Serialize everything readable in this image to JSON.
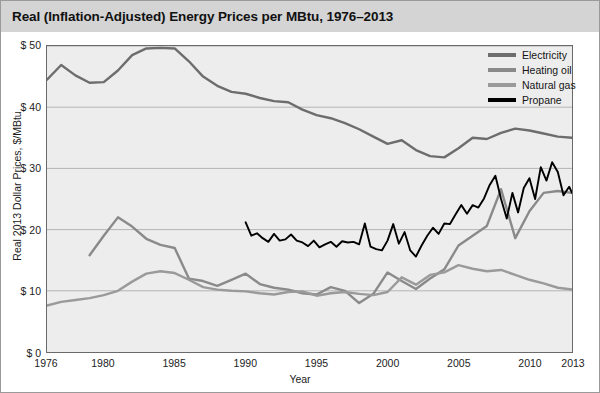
{
  "title": "Real (Inflation-Adjusted) Energy Prices per MBtu, 1976–2013",
  "axes": {
    "y_title": "Real 2013 Dollar Prices, $/MBtu",
    "x_title": "Year",
    "y_ticks": [
      "$ 0",
      "$ 10",
      "$ 20",
      "$ 30",
      "$ 40",
      "$ 50"
    ],
    "x_ticks": [
      "1976",
      "1980",
      "1985",
      "1990",
      "1995",
      "2000",
      "2005",
      "2010",
      "2013"
    ]
  },
  "legend": {
    "items": [
      {
        "label": "Electricity",
        "color": "#6d6d6d"
      },
      {
        "label": "Heating oil",
        "color": "#8a8a8a"
      },
      {
        "label": "Natural gas",
        "color": "#9a9a9a"
      },
      {
        "label": "Propane",
        "color": "#000000"
      }
    ]
  },
  "colors": {
    "title_bar": "#d4d4d4",
    "plot_background": "#ededed",
    "gridline": "#b4b4b4",
    "axis": "#6a6a6a",
    "electricity": "#6d6d6d",
    "heating_oil": "#8a8a8a",
    "natural_gas": "#9a9a9a",
    "propane": "#000000"
  },
  "chart_data": {
    "type": "line",
    "title": "Real (Inflation-Adjusted) Energy Prices per MBtu, 1976–2013",
    "xlabel": "Year",
    "ylabel": "Real 2013 Dollar Prices, $/MBtu",
    "xlim": [
      1976,
      2013
    ],
    "ylim": [
      0,
      50
    ],
    "ytick_values": [
      0,
      10,
      20,
      30,
      40,
      50
    ],
    "xtick_values": [
      1976,
      1980,
      1985,
      1990,
      1995,
      2000,
      2005,
      2010,
      2013
    ],
    "grid": "horizontal",
    "legend_position": "top-right",
    "series": [
      {
        "name": "Electricity",
        "color": "#6d6d6d",
        "x": [
          1976,
          1977,
          1978,
          1979,
          1980,
          1981,
          1982,
          1983,
          1984,
          1985,
          1986,
          1987,
          1988,
          1989,
          1990,
          1991,
          1992,
          1993,
          1994,
          1995,
          1996,
          1997,
          1998,
          1999,
          2000,
          2001,
          2002,
          2003,
          2004,
          2005,
          2006,
          2007,
          2008,
          2009,
          2010,
          2011,
          2012,
          2013
        ],
        "values": [
          44.5,
          46.9,
          45.2,
          44.0,
          44.1,
          46.0,
          48.5,
          49.6,
          49.7,
          49.6,
          47.5,
          45.0,
          43.5,
          42.5,
          42.2,
          41.5,
          41.0,
          40.8,
          39.6,
          38.7,
          38.2,
          37.4,
          36.4,
          35.2,
          34.0,
          34.6,
          33.0,
          32.0,
          31.8,
          33.3,
          35.0,
          34.8,
          35.8,
          36.5,
          36.2,
          35.7,
          35.2,
          35.0
        ]
      },
      {
        "name": "Heating oil",
        "color": "#8a8a8a",
        "x": [
          1979,
          1980,
          1981,
          1982,
          1983,
          1984,
          1985,
          1986,
          1987,
          1988,
          1989,
          1990,
          1991,
          1992,
          1993,
          1994,
          1995,
          1996,
          1997,
          1998,
          1999,
          2000,
          2001,
          2002,
          2003,
          2004,
          2005,
          2006,
          2007,
          2008,
          2009,
          2010,
          2011,
          2012,
          2013
        ],
        "values": [
          15.8,
          19.0,
          22.0,
          20.5,
          18.5,
          17.5,
          17.0,
          12.0,
          11.6,
          10.8,
          11.8,
          12.8,
          11.1,
          10.5,
          10.2,
          9.6,
          9.4,
          10.6,
          10.0,
          8.0,
          9.5,
          13.0,
          11.6,
          10.3,
          12.0,
          13.5,
          17.4,
          19.0,
          20.6,
          26.6,
          18.6,
          23.0,
          26.0,
          26.3,
          26.0
        ]
      },
      {
        "name": "Natural gas",
        "color": "#9a9a9a",
        "x": [
          1976,
          1977,
          1978,
          1979,
          1980,
          1981,
          1982,
          1983,
          1984,
          1985,
          1986,
          1987,
          1988,
          1989,
          1990,
          1991,
          1992,
          1993,
          1994,
          1995,
          1996,
          1997,
          1998,
          1999,
          2000,
          2001,
          2002,
          2003,
          2004,
          2005,
          2006,
          2007,
          2008,
          2009,
          2010,
          2011,
          2012,
          2013
        ],
        "values": [
          7.6,
          8.2,
          8.5,
          8.8,
          9.3,
          10.0,
          11.5,
          12.8,
          13.2,
          12.9,
          11.8,
          10.6,
          10.2,
          10.0,
          9.9,
          9.6,
          9.4,
          9.8,
          9.9,
          9.2,
          9.6,
          9.8,
          9.5,
          9.3,
          9.8,
          12.2,
          11.0,
          12.6,
          13.0,
          14.2,
          13.6,
          13.2,
          13.4,
          12.6,
          11.8,
          11.2,
          10.5,
          10.2
        ]
      },
      {
        "name": "Propane",
        "color": "#000000",
        "x": [
          1990.0,
          1990.4,
          1990.8,
          1991.2,
          1991.6,
          1992.0,
          1992.4,
          1992.8,
          1993.2,
          1993.6,
          1994.0,
          1994.4,
          1994.8,
          1995.2,
          1995.6,
          1996.0,
          1996.4,
          1996.8,
          1997.2,
          1997.6,
          1998.0,
          1998.4,
          1998.8,
          1999.2,
          1999.6,
          2000.0,
          2000.4,
          2000.8,
          2001.2,
          2001.6,
          2002.0,
          2002.4,
          2002.8,
          2003.2,
          2003.6,
          2004.0,
          2004.4,
          2004.8,
          2005.2,
          2005.6,
          2006.0,
          2006.4,
          2006.8,
          2007.2,
          2007.6,
          2008.0,
          2008.4,
          2008.8,
          2009.2,
          2009.6,
          2010.0,
          2010.4,
          2010.8,
          2011.2,
          2011.6,
          2012.0,
          2012.4,
          2012.8,
          2013.0
        ],
        "values": [
          21.2,
          19.0,
          19.4,
          18.6,
          18.0,
          19.3,
          18.2,
          18.4,
          19.2,
          18.2,
          17.9,
          17.3,
          18.2,
          17.1,
          17.6,
          18.0,
          17.2,
          18.1,
          17.9,
          18.0,
          17.6,
          21.0,
          17.2,
          16.8,
          16.6,
          18.2,
          20.9,
          17.7,
          19.6,
          16.6,
          15.6,
          17.4,
          19.0,
          20.3,
          19.3,
          21.0,
          20.9,
          22.5,
          24.0,
          22.6,
          24.0,
          23.6,
          25.1,
          27.3,
          28.8,
          25.0,
          21.8,
          26.0,
          22.8,
          26.8,
          28.4,
          25.0,
          30.2,
          28.0,
          31.0,
          29.4,
          25.6,
          27.0,
          26.0
        ]
      }
    ]
  }
}
